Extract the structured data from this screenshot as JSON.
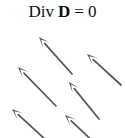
{
  "figure": {
    "title": {
      "full_text": "Div D = 0",
      "tokens": [
        {
          "text": "Div",
          "style": "plain"
        },
        {
          "text": "D",
          "style": "bold"
        },
        {
          "text": "=",
          "style": "plain"
        },
        {
          "text": "0",
          "style": "plain"
        }
      ]
    },
    "background_color": "#ffffff",
    "arrow_color": "#555555",
    "width": 125,
    "height": 138
  },
  "chart_data": {
    "type": "scatter",
    "subtype": "vector-field-quiver",
    "xlabel": "",
    "ylabel": "",
    "xlim": [
      0,
      125
    ],
    "ylim": [
      0,
      138
    ],
    "grid": false,
    "legend": null,
    "arrow_color": "#555555",
    "arrow_count": 6,
    "uniform_direction_degrees": 135,
    "vectors": [
      {
        "name": "arrow-top-middle",
        "tail_x": 72,
        "tail_y": 74,
        "tip_x": 39,
        "tip_y": 37
      },
      {
        "name": "arrow-top-right",
        "tail_x": 121,
        "tail_y": 85,
        "tip_x": 87,
        "tip_y": 54
      },
      {
        "name": "arrow-middle-left",
        "tail_x": 56,
        "tail_y": 106,
        "tip_x": 18,
        "tip_y": 67
      },
      {
        "name": "arrow-center",
        "tail_x": 99,
        "tail_y": 119,
        "tip_x": 69,
        "tip_y": 82
      },
      {
        "name": "arrow-bottom-left",
        "tail_x": 47,
        "tail_y": 141,
        "tip_x": 12,
        "tip_y": 109
      },
      {
        "name": "arrow-bottom-middle",
        "tail_x": 100,
        "tail_y": 148,
        "tip_x": 65,
        "tip_y": 115
      }
    ]
  }
}
